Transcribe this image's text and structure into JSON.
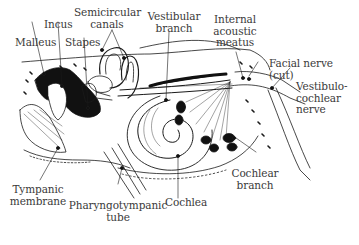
{
  "diagram": {
    "colors": {
      "ink": "#1a1a1a",
      "label_text": "#3a3a3a",
      "background": "#ffffff",
      "dark_fill": "#111111"
    },
    "labels": {
      "malleus": "Malleus",
      "incus": "Incus",
      "stapes": "Stapes",
      "semicircular_line1": "Semicircular",
      "semicircular_line2": "canals",
      "vestibular_line1": "Vestibular",
      "vestibular_line2": "branch",
      "internal_line1": "Internal",
      "internal_line2": "acoustic",
      "internal_line3": "meatus",
      "facial_line1": "Facial nerve",
      "facial_line2": "(cut)",
      "vestibulo_line1": "Vestibulo-",
      "vestibulo_line2": "cochlear",
      "vestibulo_line3": "nerve",
      "cochlear_branch_line1": "Cochlear",
      "cochlear_branch_line2": "branch",
      "cochlea": "Cochlea",
      "tympanic_line1": "Tympanic",
      "tympanic_line2": "membrane",
      "pharyngo_line1": "Pharyngotympanic",
      "pharyngo_line2": "tube"
    }
  }
}
